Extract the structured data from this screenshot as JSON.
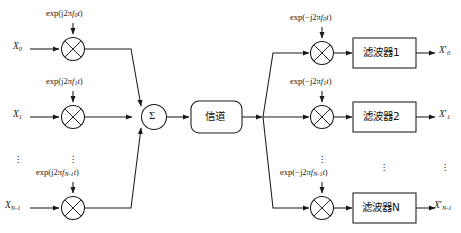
{
  "figure": {
    "type": "block-diagram",
    "ink_color": "#1a1a1a",
    "background_color": "#ffffff"
  },
  "transmitter": {
    "inputs": [
      {
        "name": "input-0",
        "base": "X",
        "sub": "0",
        "prime": ""
      },
      {
        "name": "input-1",
        "base": "X",
        "sub": "1",
        "prime": ""
      },
      {
        "name": "input-n-1",
        "base": "X",
        "sub": "N-1",
        "prime": ""
      }
    ],
    "carriers": [
      {
        "name": "carrier-0",
        "prefix": "exp(j2π",
        "f": "f",
        "sub": "0",
        "suffix": "t)"
      },
      {
        "name": "carrier-1",
        "prefix": "exp(j2π",
        "f": "f",
        "sub": "1",
        "suffix": "t)"
      },
      {
        "name": "carrier-n-1",
        "prefix": "exp(j2π",
        "f": "f",
        "sub": "N-1",
        "suffix": "t)"
      }
    ],
    "mixer_symbol": "×",
    "summer_symbol": "Σ",
    "ellipsis": "⋮"
  },
  "channel": {
    "label": "信道"
  },
  "receiver": {
    "carriers": [
      {
        "name": "carrier-0",
        "prefix": "exp(−j2π",
        "f": "f",
        "sub": "0",
        "suffix": "t)"
      },
      {
        "name": "carrier-1",
        "prefix": "exp(−j2π",
        "f": "f",
        "sub": "1",
        "suffix": "t)"
      },
      {
        "name": "carrier-n-1",
        "prefix": "exp(−j2π",
        "f": "f",
        "sub": "N-1",
        "suffix": "t)"
      }
    ],
    "filters": [
      {
        "name": "filter-1",
        "label": "滤波器1"
      },
      {
        "name": "filter-2",
        "label": "滤波器2"
      },
      {
        "name": "filter-n",
        "label": "滤波器N"
      }
    ],
    "outputs": [
      {
        "name": "output-0",
        "base": "X",
        "sub": "0",
        "prime": "′"
      },
      {
        "name": "output-1",
        "base": "X",
        "sub": "1",
        "prime": "′"
      },
      {
        "name": "output-n-1",
        "base": "X",
        "sub": "N-1",
        "prime": "′"
      }
    ],
    "mixer_symbol": "×",
    "ellipsis": "⋮"
  }
}
